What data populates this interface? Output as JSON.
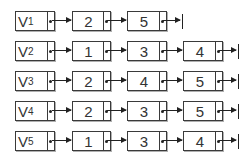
{
  "diagram": {
    "type": "adjacency-list",
    "rows": [
      {
        "head": "V",
        "sub": "1",
        "nodes": [
          "2",
          "5"
        ]
      },
      {
        "head": "V",
        "sub": "2",
        "nodes": [
          "1",
          "3",
          "4"
        ]
      },
      {
        "head": "V",
        "sub": "3",
        "nodes": [
          "2",
          "4",
          "5"
        ]
      },
      {
        "head": "V",
        "sub": "4",
        "nodes": [
          "2",
          "3",
          "5"
        ]
      },
      {
        "head": "V",
        "sub": "5",
        "nodes": [
          "1",
          "3",
          "4"
        ]
      }
    ]
  },
  "colors": {
    "border": "#3a3a3a",
    "shadow": "#b0b0b0",
    "text": "#333333",
    "background": "#ffffff"
  }
}
